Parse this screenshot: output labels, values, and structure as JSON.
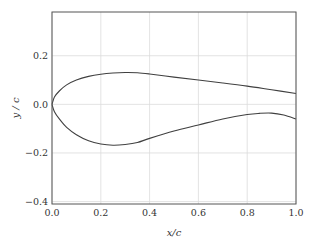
{
  "chart_data": {
    "type": "line",
    "title": "",
    "xlabel": "x/c",
    "ylabel": "y / c",
    "xlim": [
      0.0,
      1.0
    ],
    "ylim": [
      -0.41,
      0.38
    ],
    "grid": true,
    "legend": null,
    "xticks": [
      0.0,
      0.2,
      0.4,
      0.6,
      0.8,
      1.0
    ],
    "xtick_labels": [
      "0.0",
      "0.2",
      "0.4",
      "0.6",
      "0.8",
      "1.0"
    ],
    "yticks": [
      0.2,
      0.0,
      -0.2,
      -0.4
    ],
    "ytick_labels": [
      "0.2",
      "0.0",
      "−0.2",
      "−0.4"
    ],
    "series": [
      {
        "name": "upper surface",
        "color": "#404040",
        "x": [
          0.0,
          0.01,
          0.03,
          0.06,
          0.1,
          0.15,
          0.2,
          0.25,
          0.3,
          0.35,
          0.4,
          0.5,
          0.6,
          0.7,
          0.8,
          0.9,
          1.0
        ],
        "y": [
          0.0,
          0.03,
          0.055,
          0.08,
          0.1,
          0.115,
          0.124,
          0.129,
          0.131,
          0.13,
          0.125,
          0.112,
          0.1,
          0.088,
          0.075,
          0.06,
          0.045
        ]
      },
      {
        "name": "lower surface",
        "color": "#404040",
        "x": [
          0.0,
          0.01,
          0.03,
          0.06,
          0.1,
          0.15,
          0.2,
          0.25,
          0.3,
          0.35,
          0.4,
          0.5,
          0.6,
          0.7,
          0.8,
          0.85,
          0.9,
          0.95,
          1.0
        ],
        "y": [
          0.0,
          -0.03,
          -0.06,
          -0.095,
          -0.125,
          -0.15,
          -0.163,
          -0.168,
          -0.165,
          -0.157,
          -0.14,
          -0.11,
          -0.085,
          -0.06,
          -0.042,
          -0.037,
          -0.036,
          -0.044,
          -0.06
        ]
      }
    ]
  }
}
